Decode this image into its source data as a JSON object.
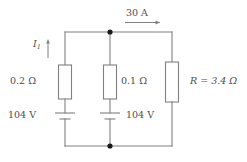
{
  "diagram": {
    "type": "electrical-schematic",
    "colors": {
      "wire": "#808080",
      "label": "#4d4d4d",
      "node": "#1a1a1a",
      "background": "#ffffff"
    },
    "labels": {
      "total_current": "30 A",
      "branch_current": "I",
      "branch_current_subscript": "1",
      "resistor_left": "0.2 Ω",
      "resistor_middle": "0.1 Ω",
      "resistor_right": "R = 3.4 Ω",
      "source_left": "104 V",
      "source_right": "104 V"
    },
    "branches": [
      {
        "name": "left-branch",
        "resistance": "0.2 Ω",
        "source": "104 V",
        "current": "I1",
        "current_direction": "up"
      },
      {
        "name": "middle-branch",
        "resistance": "0.1 Ω",
        "source": "104 V",
        "current": "",
        "current_direction": "up"
      },
      {
        "name": "right-branch",
        "resistance": "R = 3.4 Ω",
        "source": "",
        "current": "30 A",
        "current_direction": "right"
      }
    ],
    "nodes": [
      {
        "name": "top-node",
        "x": 110,
        "y": 32
      },
      {
        "name": "bottom-node",
        "x": 110,
        "y": 146
      }
    ]
  }
}
